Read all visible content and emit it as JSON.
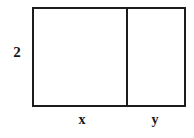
{
  "figure": {
    "type": "geometry-diagram",
    "background_color": "#ffffff",
    "stroke_color": "#1c1c1c",
    "text_color": "#17171a",
    "labels": {
      "height": "2",
      "left_width": "x",
      "right_width": "y"
    },
    "shape": {
      "outer_rect": {
        "x": 32,
        "y": 7,
        "width": 154,
        "height": 100,
        "stroke_width": 2
      },
      "divider": {
        "x": 126,
        "y_top": 7,
        "y_bottom": 107,
        "stroke_width": 2
      }
    }
  },
  "chart_data": {
    "type": "diagram",
    "title": "",
    "annotations": [
      {
        "text": "2",
        "role": "height-label",
        "side": "left",
        "x": 16,
        "y": 52
      },
      {
        "text": "x",
        "role": "width-label-left-section",
        "side": "bottom",
        "x": 82,
        "y": 121
      },
      {
        "text": "y",
        "role": "width-label-right-section",
        "side": "bottom",
        "x": 155,
        "y": 121
      }
    ]
  }
}
